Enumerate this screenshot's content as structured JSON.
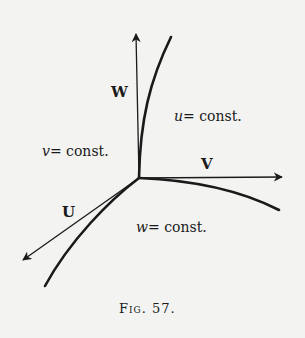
{
  "figure": {
    "caption": "Fig. 57.",
    "axes": {
      "W": {
        "label": "W"
      },
      "V": {
        "label": "V"
      },
      "U": {
        "label": "U"
      }
    },
    "regions": {
      "u": {
        "var": "u",
        "rest": "= const."
      },
      "v": {
        "var": "v",
        "rest": "= const."
      },
      "w": {
        "var": "w",
        "rest": "= const."
      }
    },
    "colors": {
      "ink": "#1a1a1a",
      "paper": "#f3f3f1"
    }
  }
}
